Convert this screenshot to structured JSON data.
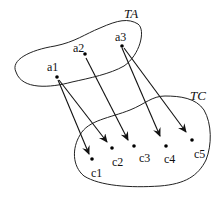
{
  "sets": {
    "ta": {
      "label": "TA"
    },
    "tc": {
      "label": "TC"
    }
  },
  "points_a": [
    {
      "label": "a1"
    },
    {
      "label": "a2"
    },
    {
      "label": "a3"
    }
  ],
  "points_c": [
    {
      "label": "c1"
    },
    {
      "label": "c2"
    },
    {
      "label": "c3"
    },
    {
      "label": "c4"
    },
    {
      "label": "c5"
    }
  ],
  "mappings": [
    {
      "from": "a1",
      "to": "c1"
    },
    {
      "from": "a1",
      "to": "c2"
    },
    {
      "from": "a2",
      "to": "c3"
    },
    {
      "from": "a3",
      "to": "c4"
    },
    {
      "from": "a3",
      "to": "c5"
    }
  ]
}
